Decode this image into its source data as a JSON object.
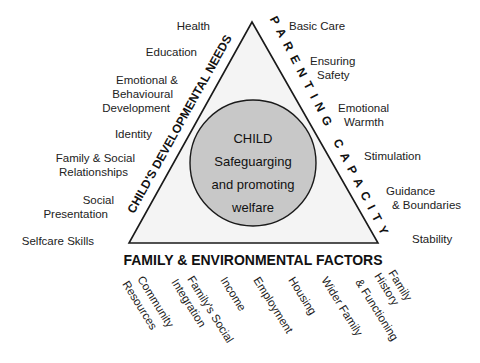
{
  "diagram": {
    "center": {
      "lines": [
        "CHILD",
        "Safeguarging",
        "and promoting",
        "welfare"
      ]
    },
    "sides": {
      "left": "CHILD'S DEVELOPMENTAL NEEDS",
      "right": "PARENTING CAPACITY",
      "bottom": "FAMILY & ENVIRONMENTAL FACTORS"
    },
    "left_items": [
      {
        "lines": [
          "Health"
        ]
      },
      {
        "lines": [
          "Education"
        ]
      },
      {
        "lines": [
          "Emotional &",
          "Behavioural",
          "Development"
        ]
      },
      {
        "lines": [
          "Identity"
        ]
      },
      {
        "lines": [
          "Family & Social",
          "Relationships"
        ]
      },
      {
        "lines": [
          "Social",
          "Presentation"
        ]
      },
      {
        "lines": [
          "Selfcare Skills"
        ]
      }
    ],
    "right_items": [
      {
        "lines": [
          "Basic Care"
        ]
      },
      {
        "lines": [
          "Ensuring",
          "Safety"
        ]
      },
      {
        "lines": [
          "Emotional",
          "Warmth"
        ]
      },
      {
        "lines": [
          "Stimulation"
        ]
      },
      {
        "lines": [
          "Guidance",
          "& Boundaries"
        ]
      },
      {
        "lines": [
          "Stability"
        ]
      }
    ],
    "bottom_items": [
      {
        "lines": [
          "Community",
          "Resources"
        ]
      },
      {
        "lines": [
          "Family's Social",
          "Integration"
        ]
      },
      {
        "lines": [
          "Income"
        ]
      },
      {
        "lines": [
          "Employment"
        ]
      },
      {
        "lines": [
          "Housing"
        ]
      },
      {
        "lines": [
          "Wider Family"
        ]
      },
      {
        "lines": [
          "Family",
          "History",
          "& Functioning"
        ]
      }
    ],
    "colors": {
      "triangle_fill": "#f4f4f4",
      "circle_fill": "#c8c8c8",
      "stroke": "#1a1a1a"
    }
  }
}
